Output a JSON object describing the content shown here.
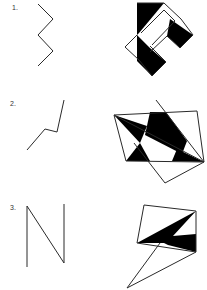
{
  "figures": [
    {
      "label": "1.",
      "label_pos": [
        12,
        4
      ],
      "left_polyline": "38,4 53,19 38,35 53,51 38,66",
      "right_shape": {
        "outline": [
          "137,3 164,3 181,19 193,35 180,48 167,36 150,52",
          "137,35 125,47 139,60 152,76 166,62 150,46",
          "141,33 164,10 175,21 152,45"
        ],
        "black_regions": [
          "137,3 164,3 139,33 137,35",
          "170,19 193,35 180,48 167,36",
          "137,35 150,48 166,62 152,76 137,61"
        ]
      }
    },
    {
      "label": "2.",
      "label_pos": [
        10,
        100
      ],
      "left_polyline": "27,150 45,129 57,132 64,100",
      "right_shape": {
        "outline": [
          "114,115 197,111 204,162 126,161 114,115",
          "156,100 204,162 165,183 134,143",
          "114,115 204,162"
        ],
        "black_regions": [
          "114,115 147,126 140,143",
          "150,112 166,112 187,141 182,154 145,135",
          "140,143 126,161 150,161",
          "177,149 204,162 172,161"
        ]
      }
    },
    {
      "label": "3.",
      "label_pos": [
        10,
        204
      ],
      "left_polyline": "27,267 27,206 64,263 64,204",
      "right_shape": {
        "outline": [
          "144,205 196,211 196,252 137,243 144,205",
          "127,288 160,243",
          "127,288 196,252"
        ],
        "black_regions": [
          "137,243 196,211 173,236 196,234 196,252 168,245 164,243"
        ]
      }
    }
  ],
  "colors": {
    "stroke": "#2a2a2a",
    "fill": "#000000",
    "label": "#333333"
  }
}
